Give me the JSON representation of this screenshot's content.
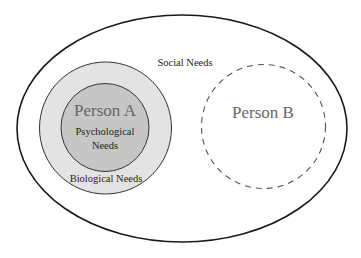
{
  "diagram": {
    "outer": {
      "label": "Social Needs"
    },
    "person_a": {
      "label": "Person A",
      "inner_label_line1": "Psychological",
      "inner_label_line2": "Needs",
      "ring_label": "Biological Needs"
    },
    "person_b": {
      "label": "Person B"
    },
    "colors": {
      "outer_stroke": "#1a1a1a",
      "ring_fill": "#e3e3e3",
      "core_fill": "#c6c6c6",
      "text": "#222222",
      "person_label": "#666666"
    }
  }
}
